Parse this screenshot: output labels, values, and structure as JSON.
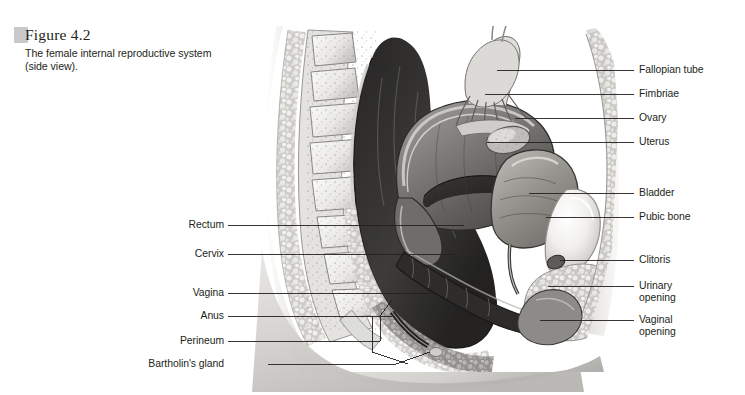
{
  "figure": {
    "number": "Figure 4.2",
    "caption": "The female internal reproductive system (side view).",
    "tab_color": "#c9c9c9"
  },
  "illustration": {
    "name": "female-internal-reproductive-system-sagittal",
    "style": "grayscale-medical-airbrush",
    "palette": {
      "background": "#ffffff",
      "ink": "#231f20",
      "skin_light": "#f2f1ef",
      "skin_mid": "#d8d6d2",
      "skin_shadow": "#a9a7a3",
      "cavity_dark": "#3a3a3a",
      "cavity_darkest": "#262626",
      "organ_mid": "#8d8b88",
      "organ_light": "#cfcdc9",
      "bone_light": "#efeeec",
      "bone_edge": "#b6b4b0"
    }
  },
  "labels": {
    "right": [
      {
        "text": "Fallopian tube",
        "y": 70,
        "leader_from_x": 606,
        "leader_to_x": 497,
        "leader_y": 70,
        "target_y": 70
      },
      {
        "text": "Fimbriae",
        "y": 94,
        "leader_from_x": 606,
        "leader_to_x": 485,
        "leader_y": 94,
        "target_y": 94
      },
      {
        "text": "Ovary",
        "y": 118,
        "leader_from_x": 606,
        "leader_to_x": 515,
        "leader_y": 118,
        "target_y": 118
      },
      {
        "text": "Uterus",
        "y": 142,
        "leader_from_x": 606,
        "leader_to_x": 487,
        "leader_y": 142,
        "target_y": 142
      },
      {
        "text": "Bladder",
        "y": 193,
        "leader_from_x": 606,
        "leader_to_x": 529,
        "leader_y": 193,
        "target_y": 193
      },
      {
        "text": "Pubic bone",
        "y": 217,
        "leader_from_x": 606,
        "leader_to_x": 546,
        "leader_y": 217,
        "target_y": 217
      },
      {
        "text": "Clitoris",
        "y": 260,
        "leader_from_x": 606,
        "leader_to_x": 560,
        "leader_y": 260,
        "target_y": 260
      },
      {
        "text": "Urinary",
        "text2": "opening",
        "y": 286,
        "leader_from_x": 606,
        "leader_to_x": 548,
        "leader_y": 286,
        "target_y": 286
      },
      {
        "text": "Vaginal",
        "text2": "opening",
        "y": 320,
        "leader_from_x": 606,
        "leader_to_x": 540,
        "leader_y": 320,
        "target_y": 320
      }
    ],
    "left": [
      {
        "text": "Rectum",
        "y": 225,
        "leader_from_x": 224,
        "leader_to_x": 464,
        "leader_y": 225
      },
      {
        "text": "Cervix",
        "y": 254,
        "leader_from_x": 224,
        "leader_to_x": 455,
        "leader_y": 254
      },
      {
        "text": "Vagina",
        "y": 293,
        "leader_from_x": 224,
        "leader_to_x": 432,
        "leader_y": 293
      },
      {
        "text": "Anus",
        "y": 316,
        "leader_from_x": 224,
        "leader_to_x": 392,
        "leader_y": 316
      },
      {
        "text": "Perineum",
        "y": 341,
        "leader_from_x": 224,
        "leader_to_x": 407,
        "leader_y": 341
      },
      {
        "text": "Bartholin's gland",
        "y": 364,
        "leader_from_x": 224,
        "leader_to_x": 430,
        "leader_y": 364
      }
    ]
  }
}
